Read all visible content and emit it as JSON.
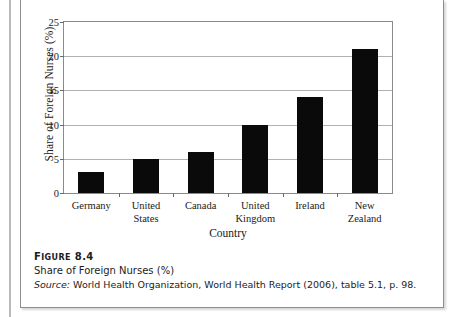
{
  "chart_data": {
    "type": "bar",
    "title": "",
    "xlabel": "Country",
    "ylabel": "Share of Foreign Nurses (%)",
    "categories": [
      "Germany",
      "United States",
      "Canada",
      "United Kingdom",
      "Ireland",
      "New Zealand"
    ],
    "values": [
      3,
      5,
      6,
      10,
      14,
      21
    ],
    "ylim": [
      0,
      25
    ],
    "ytick_values": [
      0,
      5,
      10,
      15,
      20,
      25
    ],
    "ytick_labels": [
      "0",
      "5",
      "10",
      "15",
      "20",
      "25"
    ],
    "grid": "horizontal",
    "legend": "none",
    "bar_color": "#0a0a0a"
  },
  "caption": {
    "figure_label_prefix": "F",
    "figure_label_rest": "IGURE",
    "figure_number": "8.4",
    "title": "Share of Foreign Nurses (%)",
    "source_label": "Source:",
    "source_text": " World Health Organization, World Health Report (2006), table 5.1, p. 98."
  }
}
